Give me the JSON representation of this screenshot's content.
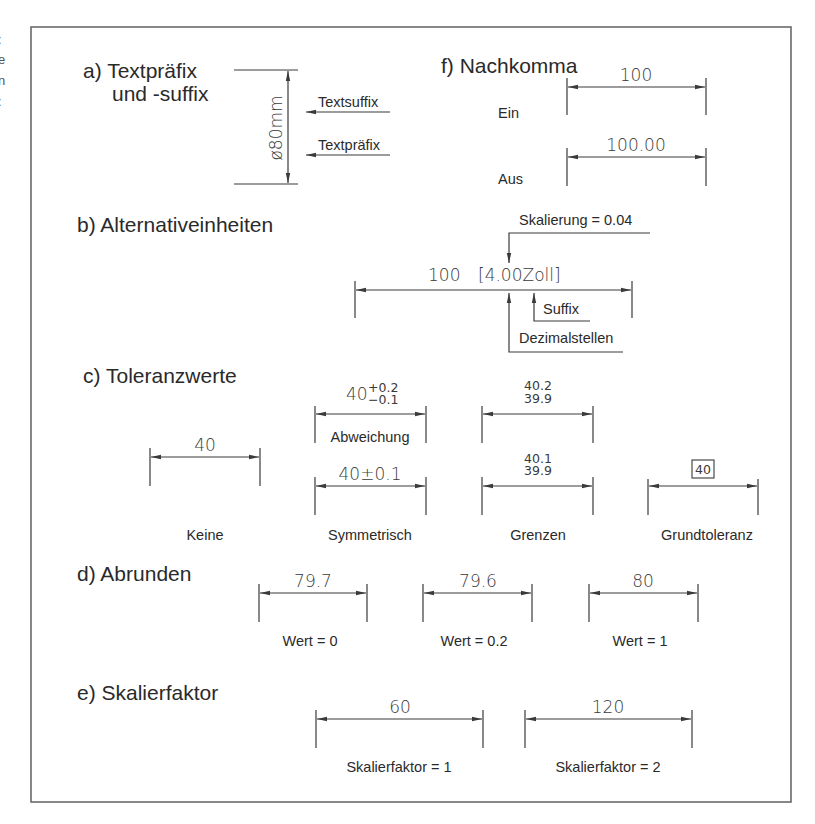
{
  "edge_fragments": [
    ":",
    "e",
    "n",
    ":"
  ],
  "sections": {
    "a": {
      "title_line1": "a) Textpräfix",
      "title_line2": "und -suffix",
      "dimension_text": "ø80mm",
      "callout_suffix": "Textsuffix",
      "callout_prefix": "Textpräfix"
    },
    "f": {
      "title": "f) Nachkomma",
      "rows": [
        {
          "value": "100",
          "label": "Ein"
        },
        {
          "value": "100.00",
          "label": "Aus"
        }
      ]
    },
    "b": {
      "title": "b) Alternativeinheiten",
      "dimension_main": "100",
      "dimension_alt": "[4.00Zoll]",
      "callout_scale": "Skalierung = 0.04",
      "callout_suffix": "Suffix",
      "callout_decimals": "Dezimalstellen"
    },
    "c": {
      "title": "c) Toleranzwerte",
      "keine": {
        "value": "40",
        "label": "Keine"
      },
      "abweichung": {
        "base": "40",
        "upper": "+0.2",
        "lower": "−0.1",
        "label": "Abweichung"
      },
      "symmetrisch": {
        "value": "40±0.1",
        "label": "Symmetrisch"
      },
      "grenzen_top": {
        "upper": "40.2",
        "lower": "39.9"
      },
      "grenzen_bottom": {
        "upper": "40.1",
        "lower": "39.9",
        "label": "Grenzen"
      },
      "grundtoleranz": {
        "value": "40",
        "label": "Grundtoleranz"
      }
    },
    "d": {
      "title": "d) Abrunden",
      "items": [
        {
          "value": "79.7",
          "label": "Wert = 0"
        },
        {
          "value": "79.6",
          "label": "Wert = 0.2"
        },
        {
          "value": "80",
          "label": "Wert = 1"
        }
      ]
    },
    "e": {
      "title": "e) Skalierfaktor",
      "items": [
        {
          "value": "60",
          "label": "Skalierfaktor = 1"
        },
        {
          "value": "120",
          "label": "Skalierfaktor = 2"
        }
      ]
    }
  }
}
